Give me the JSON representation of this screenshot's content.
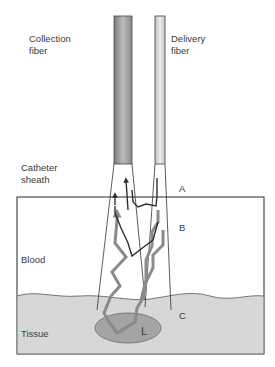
{
  "labels": {
    "collection_fiber": [
      "Collection",
      "fiber"
    ],
    "delivery_fiber": [
      "Delivery",
      "fiber"
    ],
    "catheter_sheath": [
      "Catheter",
      "sheath"
    ],
    "blood": "Blood",
    "tissue": "Tissue",
    "point_a": "A",
    "point_b": "B",
    "point_c": "C",
    "lesion": "L"
  },
  "colors": {
    "tissue_fill": "#d7d7d7",
    "lesion_fill": "#a4a4a4",
    "collection_fiber": "#9e9e9e",
    "delivery_fiber": "#d0d0d0",
    "light_path_gray": "#8a8a8a",
    "light_path_dark": "#2e2e2e"
  }
}
